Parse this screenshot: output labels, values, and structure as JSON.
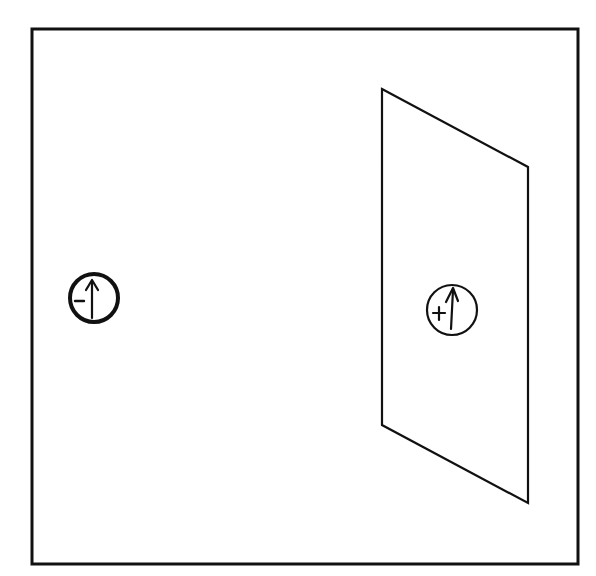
{
  "diagram": {
    "frame": {
      "x": 32,
      "y": 29,
      "width": 546,
      "height": 535
    },
    "plane": {
      "points": [
        [
          382,
          89
        ],
        [
          528,
          167
        ],
        [
          528,
          503
        ],
        [
          382,
          425
        ]
      ]
    },
    "left_marker": {
      "cx": 94,
      "cy": 298,
      "r": 24,
      "sign": "-",
      "arrow": "up-arrow"
    },
    "right_marker": {
      "cx": 451,
      "cy": 310,
      "r": 25,
      "sign": "+",
      "arrow": "up-arrow"
    },
    "colors": {
      "stroke": "#111111",
      "background": "#ffffff"
    }
  }
}
